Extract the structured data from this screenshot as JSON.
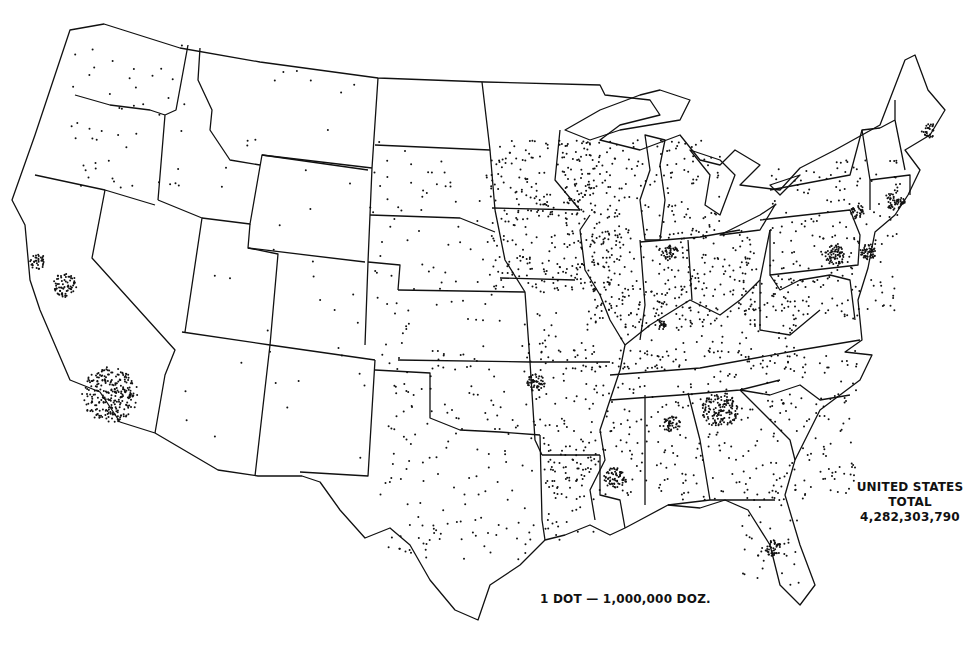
{
  "map": {
    "type": "dot-density",
    "subject": "United States production (dozens)",
    "legend": {
      "label": "1 DOT — 1,000,000 DOZ.",
      "dot_value": 1000000,
      "unit": "DOZ."
    },
    "total": {
      "line1": "UNITED STATES",
      "line2": "TOTAL",
      "value": "4,282,303,790"
    },
    "ink_color": "#111111",
    "background_color": "#ffffff",
    "dense_clusters": [
      {
        "region": "Southern California",
        "x": 110,
        "y": 395,
        "r": 28,
        "n": 260
      },
      {
        "region": "Central California",
        "x": 65,
        "y": 285,
        "r": 12,
        "n": 70
      },
      {
        "region": "San Francisco Bay",
        "x": 38,
        "y": 262,
        "r": 8,
        "n": 35
      },
      {
        "region": "North Georgia",
        "x": 720,
        "y": 410,
        "r": 18,
        "n": 140
      },
      {
        "region": "North Alabama",
        "x": 672,
        "y": 424,
        "r": 9,
        "n": 45
      },
      {
        "region": "Central Mississippi",
        "x": 615,
        "y": 478,
        "r": 11,
        "n": 65
      },
      {
        "region": "NW Arkansas",
        "x": 536,
        "y": 383,
        "r": 9,
        "n": 55
      },
      {
        "region": "SE Pennsylvania",
        "x": 835,
        "y": 255,
        "r": 10,
        "n": 70
      },
      {
        "region": "New Jersey",
        "x": 868,
        "y": 252,
        "r": 8,
        "n": 55
      },
      {
        "region": "Connecticut",
        "x": 895,
        "y": 200,
        "r": 10,
        "n": 55
      },
      {
        "region": "SE New York",
        "x": 858,
        "y": 212,
        "r": 7,
        "n": 35
      },
      {
        "region": "Maine",
        "x": 928,
        "y": 130,
        "r": 8,
        "n": 30
      },
      {
        "region": "Tampa Florida",
        "x": 773,
        "y": 548,
        "r": 8,
        "n": 45
      },
      {
        "region": "Indiana",
        "x": 670,
        "y": 252,
        "r": 8,
        "n": 35
      },
      {
        "region": "Southern Indiana",
        "x": 660,
        "y": 325,
        "r": 6,
        "n": 22
      }
    ],
    "scatter_regions": [
      {
        "region": "Midwest corn belt",
        "x0": 490,
        "y0": 140,
        "x1": 620,
        "y1": 290,
        "n": 330
      },
      {
        "region": "Illinois/Indiana/Ohio",
        "x0": 590,
        "y0": 230,
        "x1": 760,
        "y1": 330,
        "n": 260
      },
      {
        "region": "Michigan/Wisconsin",
        "x0": 560,
        "y0": 140,
        "x1": 720,
        "y1": 240,
        "n": 140
      },
      {
        "region": "Southeast",
        "x0": 540,
        "y0": 350,
        "x1": 860,
        "y1": 500,
        "n": 420
      },
      {
        "region": "Missouri/Kentucky/Tennessee",
        "x0": 520,
        "y0": 280,
        "x1": 800,
        "y1": 370,
        "n": 180
      },
      {
        "region": "Northeast",
        "x0": 770,
        "y0": 160,
        "x1": 900,
        "y1": 320,
        "n": 200
      },
      {
        "region": "Texas/Oklahoma",
        "x0": 380,
        "y0": 360,
        "x1": 540,
        "y1": 560,
        "n": 150
      },
      {
        "region": "Plains",
        "x0": 370,
        "y0": 150,
        "x1": 500,
        "y1": 360,
        "n": 90
      },
      {
        "region": "Mountain West",
        "x0": 160,
        "y0": 60,
        "x1": 380,
        "y1": 460,
        "n": 45
      },
      {
        "region": "Pacific Northwest",
        "x0": 70,
        "y0": 40,
        "x1": 190,
        "y1": 190,
        "n": 45
      },
      {
        "region": "Florida",
        "x0": 740,
        "y0": 480,
        "x1": 800,
        "y1": 590,
        "n": 40
      },
      {
        "region": "Louisiana",
        "x0": 545,
        "y0": 450,
        "x1": 600,
        "y1": 540,
        "n": 45
      }
    ]
  }
}
